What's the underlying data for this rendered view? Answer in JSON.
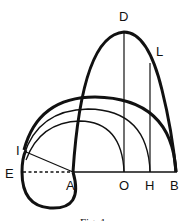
{
  "figure": {
    "caption": "Fig. 1",
    "labels": {
      "D": "D",
      "L": "L",
      "I": "I",
      "E": "E",
      "A": "A",
      "O": "O",
      "H": "H",
      "B": "B"
    },
    "colors": {
      "stroke": "#111111",
      "background": "#ffffff"
    }
  }
}
